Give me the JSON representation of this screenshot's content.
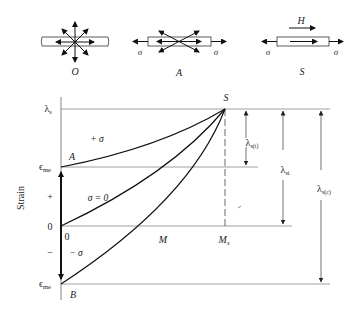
{
  "figure": {
    "type": "magnetostriction strain vs magnetization diagram",
    "domain_states": [
      {
        "id": "O",
        "label": "O",
        "description": "random domain orientation, no stress"
      },
      {
        "id": "A",
        "label": "A",
        "stress_label": "σ",
        "description": "tensile stress, domains aligned along stress axis"
      },
      {
        "id": "S",
        "label": "S",
        "stress_label": "σ",
        "field_label": "H",
        "description": "saturated along field H"
      }
    ],
    "axis": {
      "ylabel": "Strain",
      "y_ticks": [
        {
          "label": "λs",
          "sub": "s",
          "base": "λ"
        },
        {
          "label": "ϵme",
          "base": "ϵ",
          "sub": "me"
        },
        {
          "label": "+"
        },
        {
          "label": "0"
        },
        {
          "label": "−"
        },
        {
          "label": "ϵme",
          "base": "ϵ",
          "sub": "me"
        }
      ],
      "x_ticks": [
        {
          "label": "0"
        },
        {
          "label": "M"
        },
        {
          "label": "Ms",
          "base": "M",
          "sub": "s"
        }
      ]
    },
    "points": {
      "S": "S",
      "A": "A",
      "B": "B"
    },
    "curves": [
      {
        "label": "+ σ",
        "name": "tensile-stress-curve"
      },
      {
        "label": "σ = 0",
        "name": "zero-stress-curve"
      },
      {
        "label": "− σ",
        "name": "compressive-stress-curve"
      }
    ],
    "dimensions": [
      {
        "label": "λs(t)",
        "base": "λ",
        "sub": "s(t)"
      },
      {
        "label": "λsi",
        "base": "λ",
        "sub": "si"
      },
      {
        "label": "λs(c)",
        "base": "λ",
        "sub": "s(c)"
      }
    ]
  }
}
